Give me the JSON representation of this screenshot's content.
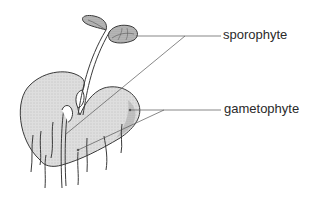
{
  "diagram": {
    "labels": [
      {
        "id": "sporophyte",
        "text": "sporophyte"
      },
      {
        "id": "gametophyte",
        "text": "gametophyte"
      }
    ],
    "colors": {
      "fill": "#d9d9d9",
      "outline": "#3a3a3a",
      "leader_line": "#555555",
      "text": "#2a2a2a"
    }
  }
}
